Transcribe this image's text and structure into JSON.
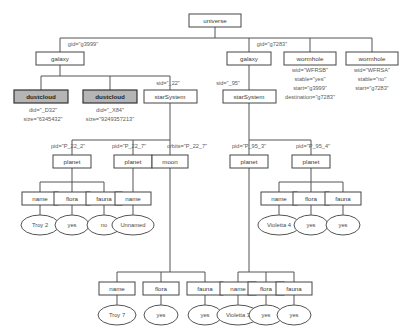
{
  "diagram": {
    "root": "universe",
    "colors": {
      "shaded_node_fill": "#b5b5b5",
      "node_stroke": "#444444",
      "edge_stroke": "#555555",
      "text": "#3a3a3a",
      "background": "#ffffff"
    },
    "nodes": {
      "universe": "universe",
      "galaxy_left": "galaxy",
      "galaxy_right": "galaxy",
      "wormhole_b": "wormhole",
      "wormhole_a": "wormhole",
      "dustcloud_1": "dustcloud",
      "dustcloud_2": "dustcloud",
      "starsystem_22": "starSystem",
      "starsystem_95": "starSystem",
      "planet_22_2": "planet",
      "planet_22_7": "planet",
      "moon_22_7": "moon",
      "planet_95_3": "planet",
      "planet_95_4": "planet",
      "name_p22_2": "name",
      "flora_p22_2": "flora",
      "fauna_p22_2": "fauna",
      "name_moon": "name",
      "name_p95_3": "name",
      "flora_p95_3": "flora",
      "fauna_p95_3": "fauna",
      "name_p22_7": "name",
      "flora_p22_7": "flora",
      "fauna_p22_7": "fauna",
      "name_p95_4": "name",
      "flora_p95_4": "flora",
      "fauna_p95_4": "fauna"
    },
    "values": {
      "name_p22_2": "Troy 2",
      "flora_p22_2": "yes",
      "fauna_p22_2": "no",
      "name_moon": "Unnamed",
      "name_p95_3": "Violetta 4",
      "flora_p95_3": "yes",
      "fauna_p95_3": "yes",
      "name_p22_7": "Troy 7",
      "flora_p22_7": "yes",
      "fauna_p22_7": "yes",
      "name_p95_4": "Violetta 3",
      "flora_p95_4": "yes",
      "fauna_p95_4": "yes"
    },
    "edge_labels": {
      "gid_left": "gid=\"g3999\"",
      "gid_right": "gid=\"g7283\"",
      "sid_22": "sid=\"_22\"",
      "sid_95": "sid=\"_95\"",
      "pid_22_2": "pid=\"P_22_2\"",
      "pid_22_7": "pid=\"P_22_7\"",
      "orbits_22_7": "orbits=\"P_22_7\"",
      "pid_95_3": "pid=\"P_95_3\"",
      "pid_95_4": "pid=\"P_95_4\""
    },
    "attributes": {
      "dustcloud_1": [
        "did=\"_D32\"",
        "size=\"6345432\""
      ],
      "dustcloud_2": [
        "did=\"_X84\"",
        "size=\"9249357213\""
      ],
      "wormhole_b": [
        "wid=\"WFRSB\"",
        "stable=\"yes\"",
        "start=\"g3999\"",
        "destination=\"g7283\""
      ],
      "wormhole_a": [
        "wid=\"WFRSA\"",
        "stable=\"no\"",
        "start=\"g7283\""
      ]
    }
  }
}
